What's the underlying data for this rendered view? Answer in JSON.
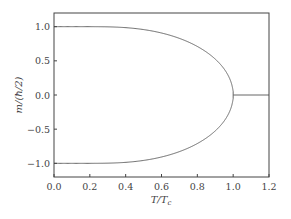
{
  "chart_data": {
    "type": "line",
    "title": "",
    "xlabel": "T/T_c",
    "ylabel": "m/(ħ/2)",
    "xlabel_display": "T/T",
    "xlabel_sub": "c",
    "ylabel_display": "m/(ħ/2)",
    "xlim": [
      0.0,
      1.2
    ],
    "ylim": [
      -1.2,
      1.2
    ],
    "grid": false,
    "legend": null,
    "x_ticks": [
      0.0,
      0.2,
      0.4,
      0.6,
      0.8,
      1.0,
      1.2
    ],
    "x_tick_labels": [
      "0.0",
      "0.2",
      "0.4",
      "0.6",
      "0.8",
      "1.0",
      "1.2"
    ],
    "y_ticks": [
      1.0,
      0.5,
      0.0,
      -0.5,
      -1.0
    ],
    "y_tick_labels": [
      "1.0",
      "0.5",
      "0.0",
      "−0.5",
      "−1.0"
    ],
    "series": [
      {
        "name": "upper branch",
        "description": "m = tanh(m/(T/Tc)), positive solution",
        "x": [
          0.0,
          0.2,
          0.4,
          0.6,
          0.8,
          0.9,
          0.95,
          1.0
        ],
        "values": [
          1.0,
          1.0,
          0.986,
          0.906,
          0.71,
          0.525,
          0.379,
          0.0
        ]
      },
      {
        "name": "lower branch",
        "description": "m = tanh(m/(T/Tc)), negative solution",
        "x": [
          0.0,
          0.2,
          0.4,
          0.6,
          0.8,
          0.9,
          0.95,
          1.0
        ],
        "values": [
          -1.0,
          -1.0,
          -0.986,
          -0.906,
          -0.71,
          -0.525,
          -0.379,
          0.0
        ]
      },
      {
        "name": "paramagnetic",
        "x": [
          1.0,
          1.2
        ],
        "values": [
          0.0,
          0.0
        ]
      }
    ],
    "colors": {
      "line": "#666666",
      "axes": "#444444",
      "text": "#444444"
    }
  }
}
